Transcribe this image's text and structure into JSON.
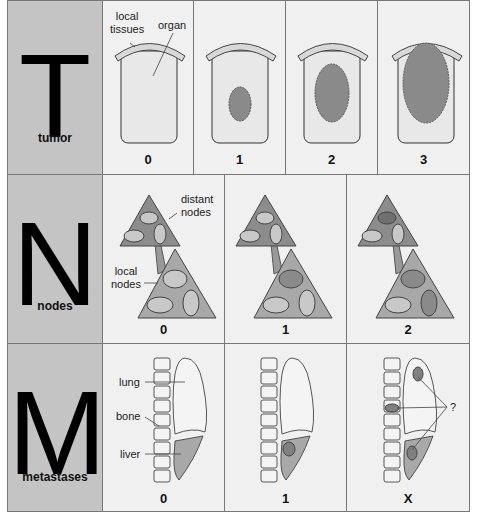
{
  "rows": [
    {
      "letter": "T",
      "label": "tumor",
      "stages": [
        "0",
        "1",
        "2",
        "3"
      ],
      "annotations": {
        "local_tissues": "local\ntissues",
        "organ": "organ"
      }
    },
    {
      "letter": "N",
      "label": "nodes",
      "stages": [
        "0",
        "1",
        "2"
      ],
      "annotations": {
        "distant_nodes": "distant\nnodes",
        "local_nodes": "local\nnodes"
      }
    },
    {
      "letter": "M",
      "label": "metastases",
      "stages": [
        "0",
        "1",
        "X"
      ],
      "annotations": {
        "lung": "lung",
        "bone": "bone",
        "liver": "liver",
        "unknown": "?"
      }
    }
  ],
  "colors": {
    "head_bg": "#c4c4c4",
    "cell_bg": "#f0f0f0",
    "tumor": "#8a8a8a",
    "tissue": "#d8d8d8",
    "node_tri_dark": "#8c8c8c",
    "node_tri_light": "#a8a8a8"
  }
}
